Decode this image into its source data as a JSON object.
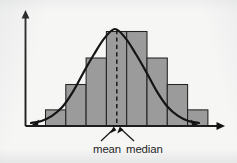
{
  "figure": {
    "title": "",
    "background_color": "#f6f6f5",
    "bar_fill_color": "#9b9b9b",
    "bar_stroke_color": "#232323",
    "curve_color": "#141414",
    "axis_color": "#1d1d1d",
    "dashed_line_color": "#1b1b1b"
  },
  "labels": {
    "mean": "mean",
    "median": "median"
  },
  "annotations": {
    "dashed_line_name": "center-line",
    "pointer_left_name": "mean-pointer",
    "pointer_right_name": "median-pointer"
  },
  "chart_data": {
    "type": "bar",
    "title": "",
    "xlabel": "",
    "ylabel": "",
    "grid": false,
    "legend": "none",
    "categories": [
      "1",
      "2",
      "3",
      "4",
      "5",
      "6",
      "7",
      "8"
    ],
    "values": [
      14,
      36,
      59,
      82,
      82,
      59,
      36,
      14
    ],
    "ylim": [
      0,
      100
    ],
    "xlim": [
      0,
      8
    ],
    "series": [
      {
        "name": "histogram",
        "values": [
          14,
          36,
          59,
          82,
          82,
          59,
          36,
          14
        ]
      },
      {
        "name": "normal-curve",
        "type": "line",
        "x": [
          0.0,
          0.5,
          1.0,
          1.5,
          2.0,
          2.5,
          3.0,
          3.5,
          4.0,
          4.5,
          5.0,
          5.5,
          6.0,
          6.5,
          7.0,
          7.5,
          8.0
        ],
        "y": [
          1,
          3,
          8,
          17,
          32,
          51,
          69,
          85,
          94,
          85,
          69,
          51,
          32,
          17,
          8,
          3,
          1
        ]
      }
    ],
    "annotations": [
      {
        "text": "mean",
        "x": 4.0,
        "y": 0,
        "note": "arrow points to center dashed line"
      },
      {
        "text": "median",
        "x": 4.0,
        "y": 0,
        "note": "arrow points to center dashed line"
      }
    ]
  }
}
